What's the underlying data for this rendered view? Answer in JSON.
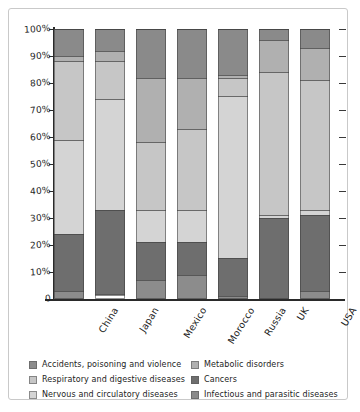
{
  "chart_data": {
    "type": "bar",
    "subtype": "stacked-100-percent",
    "title": "",
    "xlabel": "",
    "ylabel": "",
    "ylim": [
      0,
      100
    ],
    "ytick_labels": [
      "0",
      "10%",
      "20%",
      "30%",
      "40%",
      "50%",
      "60%",
      "70%",
      "80%",
      "90%",
      "100%"
    ],
    "ytick_values": [
      0,
      10,
      20,
      30,
      40,
      50,
      60,
      70,
      80,
      90,
      100
    ],
    "grid": false,
    "legend_position": "bottom",
    "categories": [
      "China",
      "Japan",
      "Mexico",
      "Morocco",
      "Russia",
      "UK",
      "USA"
    ],
    "series": [
      {
        "name": "Accidents, poisoning and violence",
        "color": "#8c8c8c",
        "values": [
          3,
          1,
          7,
          9,
          1,
          0,
          3
        ]
      },
      {
        "name": "Cancers",
        "color": "#6e6e6e",
        "values": [
          21,
          31,
          14,
          12,
          14,
          30,
          28
        ]
      },
      {
        "name": "Nervous and circulatory diseases",
        "color": "#d4d4d4",
        "values": [
          35,
          41,
          12,
          12,
          60,
          1,
          2
        ]
      },
      {
        "name": "Respiratory and digestive diseases",
        "color": "#c6c6c6",
        "values": [
          29,
          14,
          25,
          30,
          7,
          53,
          48
        ]
      },
      {
        "name": "Metabolic disorders",
        "color": "#b0b0b0",
        "values": [
          2,
          4,
          24,
          19,
          1,
          12,
          12
        ]
      },
      {
        "name": "Infectious and parasitic diseases",
        "color": "#8a8a8a",
        "values": [
          10,
          8,
          18,
          18,
          17,
          4,
          7
        ]
      }
    ]
  },
  "legend": {
    "items": [
      {
        "label": "Accidents, poisoning and violence",
        "color": "#8c8c8c"
      },
      {
        "label": "Metabolic disorders",
        "color": "#b0b0b0"
      },
      {
        "label": "Respiratory and digestive diseases",
        "color": "#c6c6c6"
      },
      {
        "label": "Cancers",
        "color": "#6e6e6e"
      },
      {
        "label": "Nervous and circulatory diseases",
        "color": "#d4d4d4"
      },
      {
        "label": "Infectious and parasitic diseases",
        "color": "#8a8a8a"
      }
    ]
  }
}
